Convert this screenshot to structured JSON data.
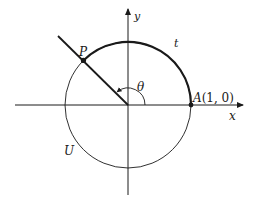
{
  "diagram": {
    "type": "unit-circle-angle",
    "axes": {
      "x_label": "x",
      "y_label": "y"
    },
    "circle_label": "U",
    "point_P_label": "P",
    "point_A_label": "A",
    "point_A_coords": "(1, 0)",
    "arc_label": "t",
    "angle_label": "θ",
    "colors": {
      "stroke": "#1a1a1a",
      "background": "#ffffff"
    }
  }
}
